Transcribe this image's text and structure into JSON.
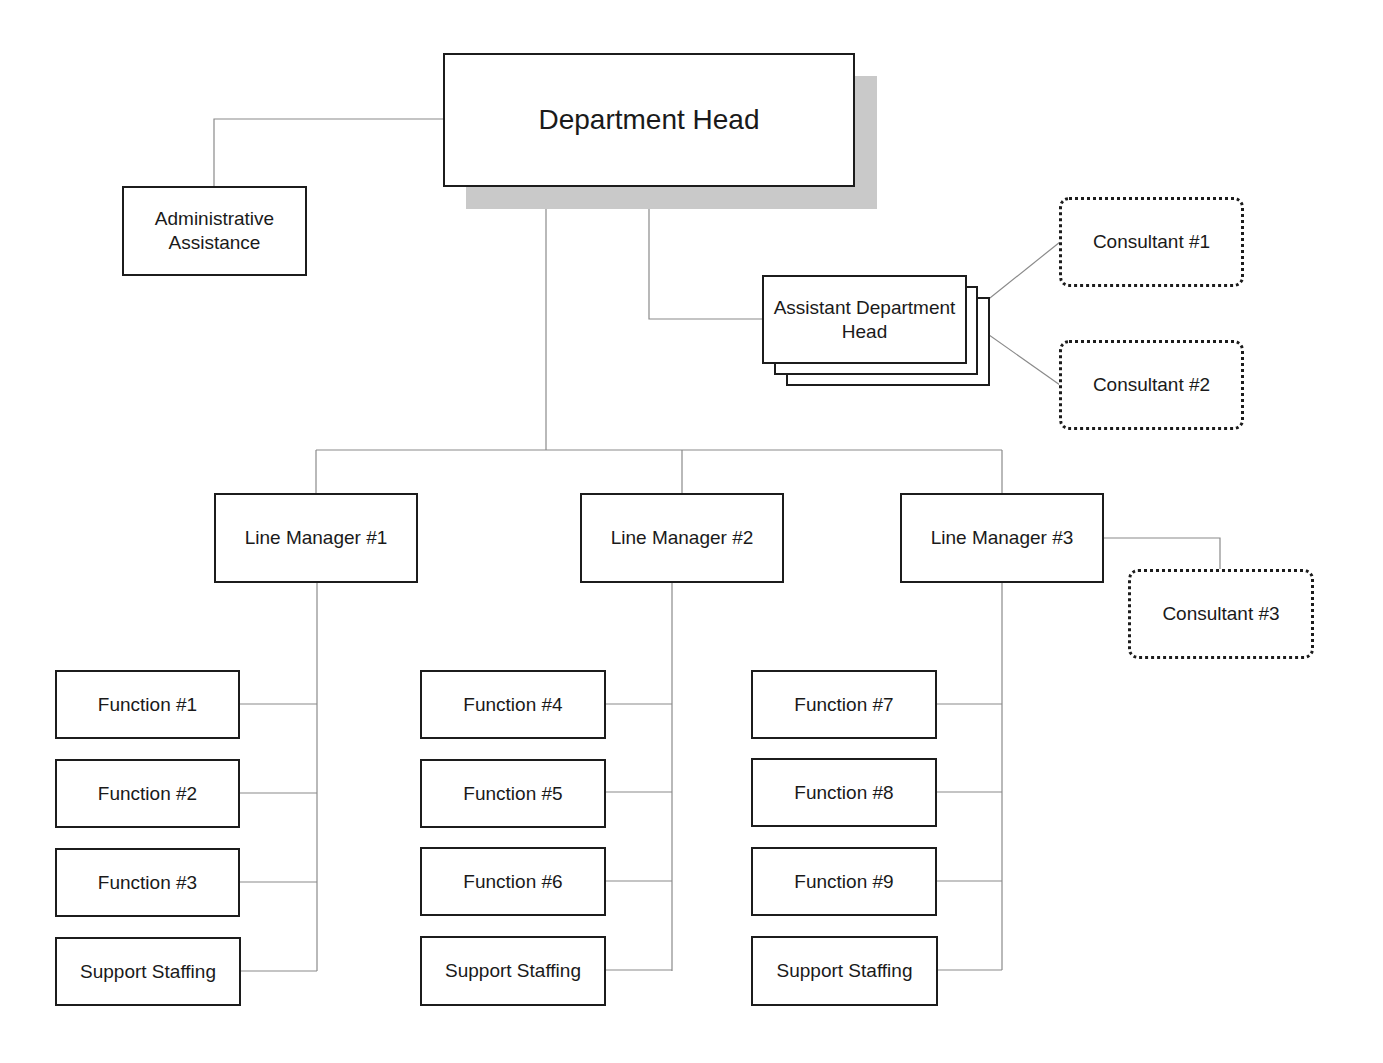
{
  "diagram": {
    "type": "org-chart",
    "colors": {
      "box_border": "#1c1c1c",
      "connector": "#8a8a8a",
      "shadow": "#c9c9c9",
      "background": "#ffffff"
    },
    "department_head": {
      "label": "Department Head"
    },
    "administrative": {
      "label": "Administrative\nAssistance"
    },
    "assistant_head": {
      "label": "Assistant Department\nHead"
    },
    "consultants": [
      {
        "label": "Consultant #1"
      },
      {
        "label": "Consultant #2"
      },
      {
        "label": "Consultant #3"
      }
    ],
    "line_managers": [
      {
        "label": "Line Manager #1",
        "reports": [
          {
            "label": "Function #1"
          },
          {
            "label": "Function #2"
          },
          {
            "label": "Function #3"
          },
          {
            "label": "Support Staffing"
          }
        ]
      },
      {
        "label": "Line Manager #2",
        "reports": [
          {
            "label": "Function #4"
          },
          {
            "label": "Function #5"
          },
          {
            "label": "Function #6"
          },
          {
            "label": "Support Staffing"
          }
        ]
      },
      {
        "label": "Line Manager #3",
        "reports": [
          {
            "label": "Function #7"
          },
          {
            "label": "Function #8"
          },
          {
            "label": "Function #9"
          },
          {
            "label": "Support Staffing"
          }
        ]
      }
    ]
  }
}
